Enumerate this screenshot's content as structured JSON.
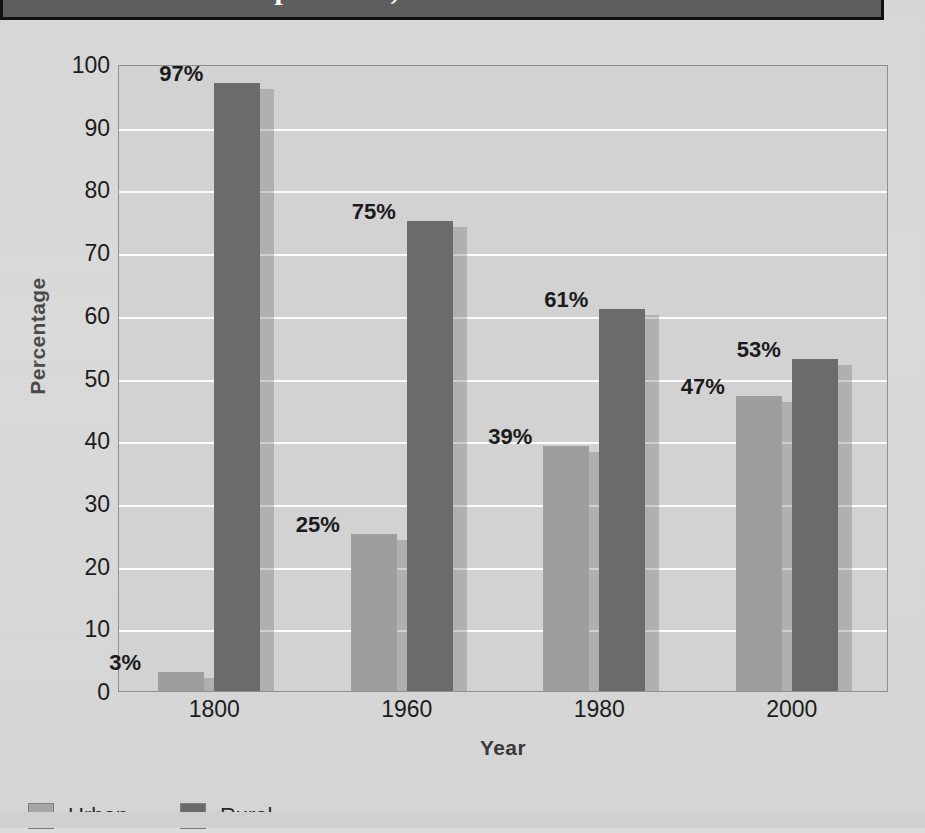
{
  "title": "Urban and Rural Populations, 1800-2000",
  "legend": {
    "urban_label": "Urban",
    "rural_label": "Rural"
  },
  "colors": {
    "urban": "#9e9e9e",
    "rural": "#6b6b6b",
    "plot_background": "#d2d2d2",
    "gridline": "#fdfdfd",
    "page_background": "#dcdcdc",
    "title_banner": "#5e5e5e",
    "title_text": "#ffffff"
  },
  "ghost_text": [
    "the reverse side of this page shows through",
    "faint lines of text are visible behind the chart",
    "scanned from a printed textbook page",
    "the image carries paper grain and bleed-through",
    "population distribution changed dramatically",
    "over the course of two centuries of growth",
    "industrialization drew people into the cities",
    "and away from the farms and the countryside"
  ],
  "chart_data": {
    "type": "bar",
    "title": "Urban and Rural Populations, 1800-2000",
    "xlabel": "Year",
    "ylabel": "Percentage",
    "categories": [
      "1800",
      "1960",
      "1980",
      "2000"
    ],
    "series": [
      {
        "name": "Urban",
        "values": [
          3,
          25,
          39,
          47
        ],
        "labels": [
          "3%",
          "25%",
          "39%",
          "47%"
        ],
        "color": "#9e9e9e"
      },
      {
        "name": "Rural",
        "values": [
          97,
          75,
          61,
          53
        ],
        "labels": [
          "97%",
          "75%",
          "61%",
          "53%"
        ],
        "color": "#6b6b6b"
      }
    ],
    "ylim": [
      0,
      100
    ],
    "yticks": [
      "0",
      "10",
      "20",
      "30",
      "40",
      "50",
      "60",
      "70",
      "80",
      "90",
      "100"
    ],
    "grid": true,
    "legend_position": "bottom-left"
  }
}
